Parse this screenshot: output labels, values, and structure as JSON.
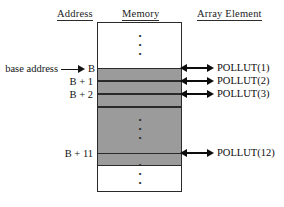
{
  "figure": {
    "headers": {
      "address": "Address",
      "memory": "Memory",
      "array_element": "Array Element"
    },
    "address_labels": {
      "base_prefix": "base address",
      "base": "B",
      "plus_1": "B + 1",
      "plus_2": "B + 2",
      "plus_11": "B + 11"
    },
    "array_elements": [
      "POLLUT(1)",
      "POLLUT(2)",
      "POLLUT(3)",
      "POLLUT(12)"
    ],
    "ellipsis": {
      "dot": "•"
    },
    "colors": {
      "allocated_band": "#9b9b9b",
      "outline": "#2a2a2a",
      "background": "#ffffff",
      "text": "#0d0d0d"
    }
  }
}
